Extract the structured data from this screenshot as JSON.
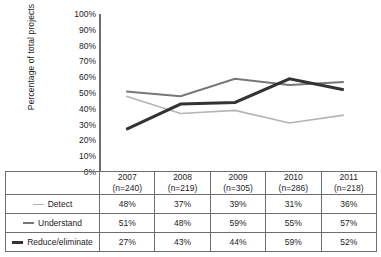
{
  "chart_data": {
    "type": "line",
    "title": "",
    "xlabel": "",
    "ylabel": "Percentage of total projects",
    "ylim": [
      0,
      100
    ],
    "grid": false,
    "legend_position": "table-left",
    "categories": [
      "2007",
      "2008",
      "2009",
      "2010",
      "2011"
    ],
    "category_sublabels": [
      "(n=240)",
      "(n=219)",
      "(n=305)",
      "(n=286)",
      "(n=218)"
    ],
    "ytick_labels": [
      "100%",
      "90%",
      "80%",
      "70%",
      "60%",
      "50%",
      "40%",
      "30%",
      "20%",
      "10%",
      "0%"
    ],
    "ytick_values": [
      100,
      90,
      80,
      70,
      60,
      50,
      40,
      30,
      20,
      10,
      0
    ],
    "series": [
      {
        "name": "Detect",
        "color": "#b4b4b4",
        "width": 1.6,
        "values": [
          48,
          37,
          39,
          31,
          36
        ],
        "labels": [
          "48%",
          "37%",
          "39%",
          "31%",
          "36%"
        ]
      },
      {
        "name": "Understand",
        "color": "#777777",
        "width": 2.0,
        "values": [
          51,
          48,
          59,
          55,
          57
        ],
        "labels": [
          "51%",
          "48%",
          "59%",
          "55%",
          "57%"
        ]
      },
      {
        "name": "Reduce/eliminate",
        "color": "#333333",
        "width": 3.0,
        "values": [
          27,
          43,
          44,
          59,
          52
        ],
        "labels": [
          "27%",
          "43%",
          "44%",
          "59%",
          "52%"
        ]
      }
    ]
  }
}
